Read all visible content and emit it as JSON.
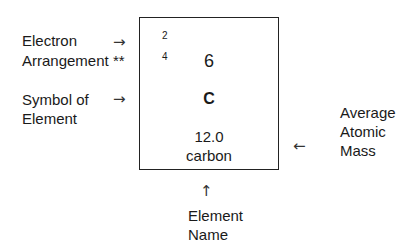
{
  "labels": {
    "electron_line1": "Electron",
    "electron_line2": "Arrangement **",
    "symbol_line1": "Symbol of",
    "symbol_line2": "Element",
    "mass_line1": "Average",
    "mass_line2": "Atomic",
    "mass_line3": "Mass",
    "name_line1": "Element",
    "name_line2": "Name"
  },
  "arrows": {
    "electron": "→",
    "symbol": "→",
    "mass": "←",
    "name": "↑"
  },
  "element": {
    "shell1": "2",
    "shell2": "4",
    "atomic_number": "6",
    "symbol": "C",
    "mass": "12.0",
    "name": "carbon"
  }
}
